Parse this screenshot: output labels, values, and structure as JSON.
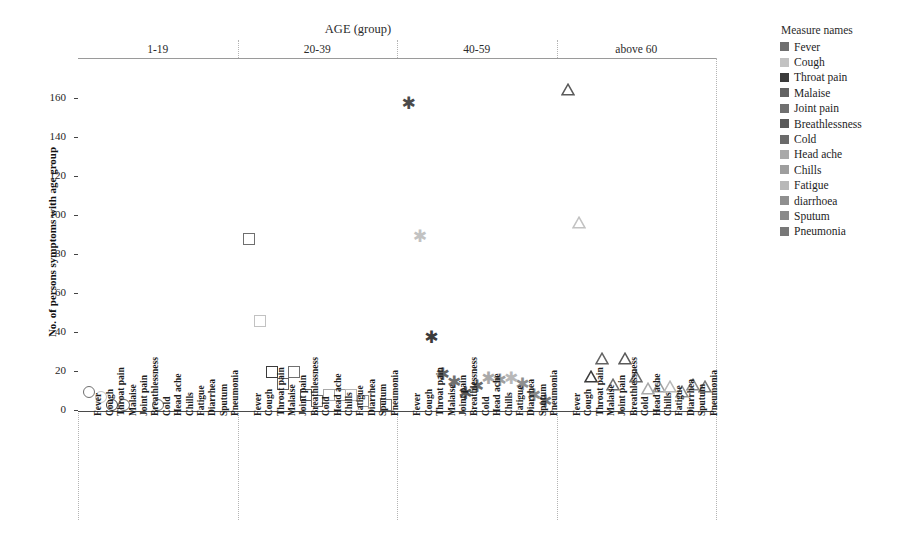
{
  "chart": {
    "column_title": "AGE (group)",
    "y_axis_title": "No. of persons symptoms with age group",
    "panels": [
      "1-19",
      "20-39",
      "40-59",
      "above 60"
    ],
    "y_ticks": [
      "0",
      "20",
      "40",
      "60",
      "80",
      "100",
      "120",
      "140",
      "160"
    ],
    "x_tick_labels": [
      "Fever",
      "Cough",
      "Throat pain",
      "Malaise",
      "Joint pain",
      "Breathlessness",
      "Cold",
      "Head ache",
      "Chills",
      "Fatigue",
      "Diarrhea",
      "Sputum",
      "Pneumonia"
    ]
  },
  "legend": {
    "title": "Measure names",
    "items": [
      {
        "label": "Fever",
        "color": "#6f6f6f"
      },
      {
        "label": "Cough",
        "color": "#c2c2c2"
      },
      {
        "label": "Throat pain",
        "color": "#3b3b3b"
      },
      {
        "label": "Malaise",
        "color": "#636363"
      },
      {
        "label": "Joint pain",
        "color": "#707070"
      },
      {
        "label": "Breathlessness",
        "color": "#5a5a5a"
      },
      {
        "label": "Cold",
        "color": "#6b6b6b"
      },
      {
        "label": "Head ache",
        "color": "#a9a9a9"
      },
      {
        "label": "Chills",
        "color": "#9e9e9e"
      },
      {
        "label": "Fatigue",
        "color": "#b8b8b8"
      },
      {
        "label": "diarrhoea",
        "color": "#8f8f8f"
      },
      {
        "label": "Sputum",
        "color": "#8a8a8a"
      },
      {
        "label": "Pneumonia",
        "color": "#787878"
      }
    ]
  },
  "chart_data": {
    "type": "scatter",
    "title": "AGE (group)",
    "xlabel": "",
    "ylabel": "No. of persons symptoms with age group",
    "ylim": [
      0,
      170
    ],
    "grid": true,
    "legend_position": "right",
    "categories": [
      "Fever",
      "Cough",
      "Throat pain",
      "Malaise",
      "Joint pain",
      "Breathlessness",
      "Cold",
      "Head ache",
      "Chills",
      "Fatigue",
      "Diarrhea",
      "Sputum",
      "Pneumonia"
    ],
    "panels": [
      {
        "name": "1-19",
        "marker": "circle",
        "points": [
          {
            "category": "Fever",
            "value": 10,
            "color": "#6f6f6f"
          },
          {
            "category": "Cough",
            "value": 7,
            "color": "#c2c2c2"
          },
          {
            "category": "Throat pain",
            "value": 3,
            "color": "#3b3b3b"
          },
          {
            "category": "Malaise",
            "value": 3,
            "color": "#636363"
          },
          {
            "category": "Joint pain",
            "value": null,
            "color": "#707070"
          },
          {
            "category": "Breathlessness",
            "value": null,
            "color": "#5a5a5a"
          },
          {
            "category": "Cold",
            "value": 3,
            "color": "#6b6b6b"
          },
          {
            "category": "Head ache",
            "value": null,
            "color": "#a9a9a9"
          },
          {
            "category": "Chills",
            "value": null,
            "color": "#9e9e9e"
          },
          {
            "category": "Fatigue",
            "value": null,
            "color": "#b8b8b8"
          },
          {
            "category": "Diarrhea",
            "value": null,
            "color": "#8f8f8f"
          },
          {
            "category": "Sputum",
            "value": null,
            "color": "#8a8a8a"
          },
          {
            "category": "Pneumonia",
            "value": null,
            "color": "#787878"
          }
        ]
      },
      {
        "name": "20-39",
        "marker": "square",
        "points": [
          {
            "category": "Fever",
            "value": 88,
            "color": "#6f6f6f"
          },
          {
            "category": "Cough",
            "value": 46,
            "color": "#c2c2c2"
          },
          {
            "category": "Throat pain",
            "value": 20,
            "color": "#3b3b3b"
          },
          {
            "category": "Malaise",
            "value": 14,
            "color": "#636363"
          },
          {
            "category": "Joint pain",
            "value": 20,
            "color": "#707070"
          },
          {
            "category": "Breathlessness",
            "value": 8,
            "color": "#5a5a5a"
          },
          {
            "category": "Cold",
            "value": 5,
            "color": "#6b6b6b"
          },
          {
            "category": "Head ache",
            "value": 8,
            "color": "#a9a9a9"
          },
          {
            "category": "Chills",
            "value": 8,
            "color": "#9e9e9e"
          },
          {
            "category": "Fatigue",
            "value": 8,
            "color": "#b8b8b8"
          },
          {
            "category": "Diarrhea",
            "value": 5,
            "color": "#8f8f8f"
          },
          {
            "category": "Sputum",
            "value": null,
            "color": "#8a8a8a"
          },
          {
            "category": "Pneumonia",
            "value": 3,
            "color": "#787878"
          }
        ]
      },
      {
        "name": "40-59",
        "marker": "star",
        "points": [
          {
            "category": "Fever",
            "value": 158,
            "color": "#4a4a4a"
          },
          {
            "category": "Cough",
            "value": 90,
            "color": "#c2c2c2"
          },
          {
            "category": "Throat pain",
            "value": 38,
            "color": "#3b3b3b"
          },
          {
            "category": "Malaise",
            "value": 19,
            "color": "#636363"
          },
          {
            "category": "Joint pain",
            "value": 15,
            "color": "#707070"
          },
          {
            "category": "Breathlessness",
            "value": 9,
            "color": "#5a5a5a"
          },
          {
            "category": "Cold",
            "value": 13,
            "color": "#6b6b6b"
          },
          {
            "category": "Head ache",
            "value": 17,
            "color": "#a9a9a9"
          },
          {
            "category": "Chills",
            "value": 16,
            "color": "#9e9e9e"
          },
          {
            "category": "Fatigue",
            "value": 17,
            "color": "#b8b8b8"
          },
          {
            "category": "Diarrhea",
            "value": 14,
            "color": "#8f8f8f"
          },
          {
            "category": "Sputum",
            "value": 8,
            "color": "#8a8a8a"
          },
          {
            "category": "Pneumonia",
            "value": 5,
            "color": "#787878"
          }
        ]
      },
      {
        "name": "above 60",
        "marker": "triangle",
        "points": [
          {
            "category": "Fever",
            "value": 164,
            "color": "#5a5a5a"
          },
          {
            "category": "Cough",
            "value": 96,
            "color": "#c2c2c2"
          },
          {
            "category": "Throat pain",
            "value": 17,
            "color": "#3b3b3b"
          },
          {
            "category": "Malaise",
            "value": 26,
            "color": "#636363"
          },
          {
            "category": "Joint pain",
            "value": 13,
            "color": "#707070"
          },
          {
            "category": "Breathlessness",
            "value": 26,
            "color": "#5a5a5a"
          },
          {
            "category": "Cold",
            "value": 17,
            "color": "#6b6b6b"
          },
          {
            "category": "Head ache",
            "value": 11,
            "color": "#a9a9a9"
          },
          {
            "category": "Chills",
            "value": 12,
            "color": "#9e9e9e"
          },
          {
            "category": "Fatigue",
            "value": 12,
            "color": "#b8b8b8"
          },
          {
            "category": "Diarrhea",
            "value": 9,
            "color": "#8f8f8f"
          },
          {
            "category": "Sputum",
            "value": 13,
            "color": "#8a8a8a"
          },
          {
            "category": "Pneumonia",
            "value": 12,
            "color": "#787878"
          }
        ]
      }
    ]
  }
}
